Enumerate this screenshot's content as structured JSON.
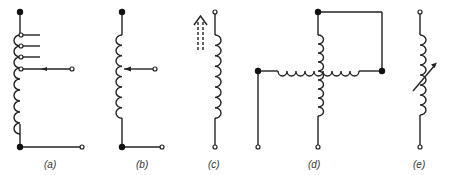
{
  "figure": {
    "panels": [
      {
        "id": "a",
        "label": "(a)",
        "description": "tapped inductor with multiple taps and movable contact"
      },
      {
        "id": "b",
        "label": "(b)",
        "description": "inductor with movable tap"
      },
      {
        "id": "c",
        "label": "(c)",
        "description": "inductor with adjustable core (dashed arrow)"
      },
      {
        "id": "d",
        "label": "(d)",
        "description": "two crossed coupled inductors"
      },
      {
        "id": "e",
        "label": "(e)",
        "description": "variable inductor with diagonal arrow"
      }
    ],
    "colors": {
      "line": "#222222",
      "background": "#ffffff"
    }
  }
}
